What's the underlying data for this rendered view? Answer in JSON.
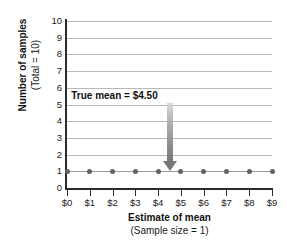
{
  "chart_data": {
    "type": "scatter",
    "title": "",
    "xlabel": "Estimate of mean",
    "xlabel_sub": "(Sample size = 1)",
    "ylabel": "Number of samples",
    "ylabel_sub": "(Total = 10)",
    "categories": [
      "$0",
      "$1",
      "$2",
      "$3",
      "$4",
      "$5",
      "$6",
      "$7",
      "$8",
      "$9"
    ],
    "x": [
      0,
      1,
      2,
      3,
      4,
      5,
      6,
      7,
      8,
      9
    ],
    "values": [
      1,
      1,
      1,
      1,
      1,
      1,
      1,
      1,
      1,
      1
    ],
    "xlim": [
      0,
      9
    ],
    "ylim": [
      0,
      10
    ],
    "y_ticks": [
      "0",
      "1",
      "2",
      "3",
      "4",
      "5",
      "6",
      "7",
      "8",
      "9",
      "10"
    ],
    "grid": true,
    "legend": "none",
    "annotations": [
      {
        "text": "True mean  =  $4.50",
        "x": 4.5,
        "y_text": 5.5,
        "y_target": 1,
        "type": "arrow-down"
      }
    ],
    "colors": {
      "point": "#636363",
      "series_line": "#9a9a9a",
      "gridline": "#b8b8b8",
      "axis": "#2b2b2b",
      "arrow": "#767676",
      "text": "#111111",
      "background": "#ffffff"
    }
  }
}
